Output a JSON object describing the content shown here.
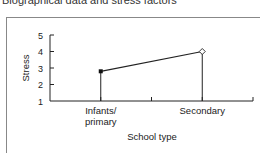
{
  "title": "Biographical data and stress factors",
  "chart_data": {
    "type": "line",
    "title": "Biographical data and stress factors",
    "xlabel": "School type",
    "ylabel": "Stress",
    "categories": [
      "Infants/ primary",
      "Secondary"
    ],
    "category_lines": [
      [
        "Infants/",
        "primary"
      ],
      [
        "Secondary"
      ]
    ],
    "values": [
      2.8,
      4.0
    ],
    "markers": [
      "filled-square",
      "open-diamond"
    ],
    "yticks": [
      1,
      2,
      3,
      4,
      5
    ],
    "ylim": [
      1,
      5
    ],
    "grid": false,
    "legend": null,
    "drop_lines": true
  }
}
